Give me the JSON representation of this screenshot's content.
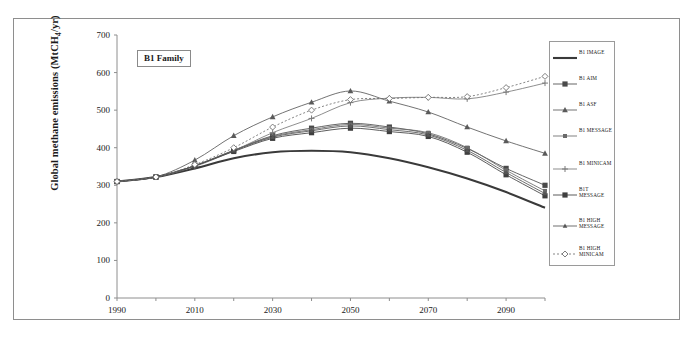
{
  "chart_data": {
    "type": "line",
    "title": "",
    "annotation": "B1 Family",
    "xlabel": "",
    "ylabel_prefix": "Global methane emissions (MtCH",
    "ylabel_sub": "4",
    "ylabel_suffix": "/yr)",
    "ylabel_full": "Global methane emissions (MtCH4/yr)",
    "xlim": [
      1990,
      2100
    ],
    "ylim": [
      0,
      700
    ],
    "ytick_step": 100,
    "yticks": [
      0,
      100,
      200,
      300,
      400,
      500,
      600,
      700
    ],
    "xticks_major": [
      1990,
      2010,
      2030,
      2050,
      2070,
      2090
    ],
    "xticks_minor": [
      2000,
      2020,
      2040,
      2060,
      2080,
      2100
    ],
    "x": [
      1990,
      2000,
      2010,
      2020,
      2030,
      2040,
      2050,
      2060,
      2070,
      2080,
      2090,
      2100
    ],
    "grid": false,
    "legend_position": "right-outside",
    "series": [
      {
        "name": "B1 IMAGE",
        "marker": "none",
        "style": "solid-thick",
        "color": "#3a3a3a",
        "values": [
          310,
          322,
          345,
          372,
          388,
          392,
          388,
          372,
          348,
          318,
          282,
          240
        ]
      },
      {
        "name": "B1 AIM",
        "marker": "square",
        "style": "solid",
        "color": "#4a4a4a",
        "values": [
          310,
          322,
          352,
          393,
          432,
          452,
          465,
          455,
          437,
          398,
          345,
          300
        ]
      },
      {
        "name": "B1 ASF",
        "marker": "triangle",
        "style": "solid",
        "color": "#5a5a5a",
        "values": [
          310,
          322,
          367,
          432,
          482,
          521,
          551,
          524,
          495,
          455,
          418,
          385
        ]
      },
      {
        "name": "B1 MESSAGE",
        "marker": "square-small",
        "style": "solid",
        "color": "#6a6a6a",
        "values": [
          310,
          322,
          352,
          393,
          430,
          448,
          462,
          452,
          440,
          400,
          340,
          285
        ]
      },
      {
        "name": "B1 MINICAM",
        "marker": "plus",
        "style": "solid",
        "color": "#7a7a7a",
        "values": [
          310,
          322,
          350,
          392,
          440,
          478,
          520,
          532,
          534,
          530,
          548,
          572
        ]
      },
      {
        "name": "B1T MESSAGE",
        "marker": "square",
        "style": "solid",
        "color": "#3f3f3f",
        "values": [
          310,
          322,
          352,
          390,
          425,
          440,
          452,
          443,
          430,
          388,
          328,
          272
        ]
      },
      {
        "name": "B1 HIGH MESSAGE",
        "marker": "triangle-small",
        "style": "solid",
        "color": "#555555",
        "values": [
          310,
          322,
          352,
          392,
          428,
          445,
          458,
          448,
          434,
          393,
          334,
          278
        ]
      },
      {
        "name": "B1 HIGH MINICAM",
        "marker": "diamond-open",
        "style": "dotted",
        "color": "#6f6f6f",
        "values": [
          310,
          322,
          355,
          400,
          455,
          500,
          528,
          531,
          534,
          536,
          560,
          590
        ]
      }
    ]
  }
}
